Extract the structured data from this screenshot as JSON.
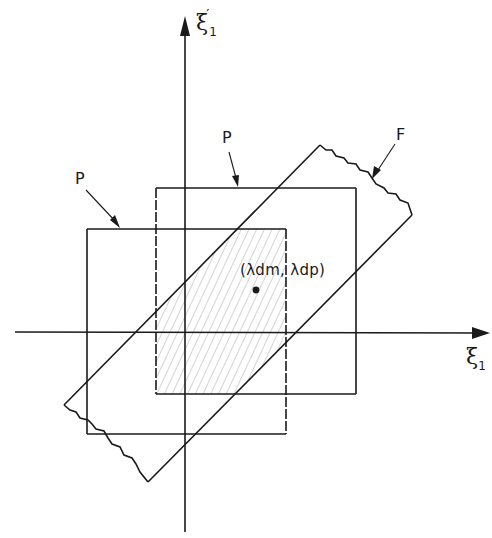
{
  "diagram": {
    "axes": {
      "horizontal_label": "ξ",
      "horizontal_subscript": "1",
      "vertical_label": "ξ",
      "vertical_subscript": "1",
      "vertical_prime": "′"
    },
    "regions": [
      {
        "name": "P",
        "label": "P",
        "role": "outer square (left)"
      },
      {
        "name": "P",
        "label": "P",
        "role": "inner square (right)"
      },
      {
        "name": "F",
        "label": "F",
        "role": "diagonal band"
      }
    ],
    "point": {
      "label": "(λdm, λdp)"
    },
    "colors": {
      "ink": "#1a1a1a",
      "hatch": "#9a9a9a",
      "background": "#ffffff"
    }
  }
}
